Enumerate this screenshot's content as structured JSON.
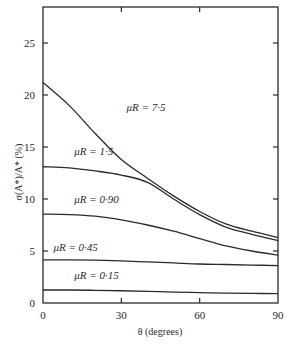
{
  "chart_data": {
    "type": "line",
    "title": "",
    "xlabel": "θ (degrees)",
    "ylabel": "σ(A*)/A* (%)",
    "xlim": [
      0,
      90
    ],
    "ylim": [
      0,
      28
    ],
    "xticks": [
      0,
      30,
      60,
      90
    ],
    "yticks": [
      0,
      5,
      10,
      15,
      20,
      25
    ],
    "grid": false,
    "legend": "inline labels on curves",
    "x": [
      0,
      10,
      20,
      30,
      40,
      50,
      60,
      70,
      80,
      90
    ],
    "series": [
      {
        "name": "μR = 7·5",
        "values": [
          21.2,
          19.0,
          16.3,
          13.8,
          12.0,
          10.3,
          8.8,
          7.6,
          6.9,
          6.3
        ]
      },
      {
        "name": "μR = 1·5",
        "values": [
          13.1,
          13.0,
          12.7,
          12.3,
          11.6,
          10.0,
          8.5,
          7.3,
          6.6,
          6.0
        ]
      },
      {
        "name": "μR = 0·90",
        "values": [
          8.55,
          8.5,
          8.35,
          8.0,
          7.5,
          6.9,
          6.2,
          5.5,
          5.0,
          4.6
        ]
      },
      {
        "name": "μR = 0·45",
        "values": [
          4.15,
          4.15,
          4.12,
          4.05,
          3.95,
          3.85,
          3.75,
          3.7,
          3.65,
          3.6
        ]
      },
      {
        "name": "μR = 0·15",
        "values": [
          1.25,
          1.25,
          1.22,
          1.18,
          1.12,
          1.05,
          1.0,
          0.95,
          0.92,
          0.9
        ]
      }
    ],
    "annotations": [
      {
        "text": "μR = 7·5",
        "x": 32,
        "y": 18.5
      },
      {
        "text": "μR = 1·5",
        "x": 12,
        "y": 14.2
      },
      {
        "text": "μR = 0·90",
        "x": 12,
        "y": 9.6
      },
      {
        "text": "μR = 0·45",
        "x": 4,
        "y": 5.0
      },
      {
        "text": "μR = 0·15",
        "x": 12,
        "y": 2.3
      }
    ]
  }
}
